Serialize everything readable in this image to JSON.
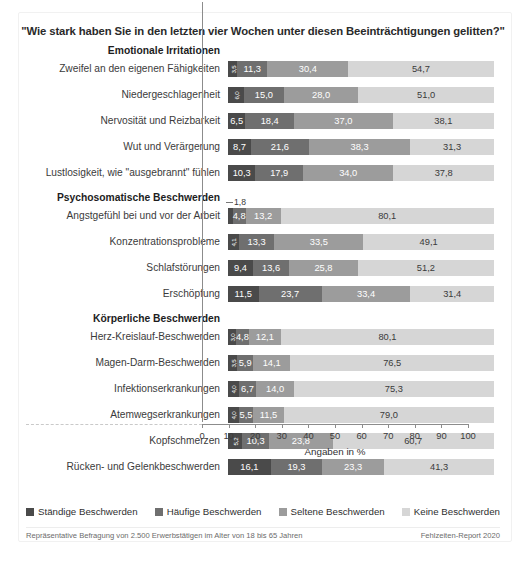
{
  "title": "\"Wie stark haben Sie in den letzten vier Wochen unter diesen Beeinträchtigungen gelitten?\"",
  "axis_title": "Angaben in %",
  "callout_1_8": "1,8",
  "legend": [
    {
      "label": "Ständige Beschwerden",
      "color": "#4a4a4a"
    },
    {
      "label": "Häufige Beschwerden",
      "color": "#6f6f6f"
    },
    {
      "label": "Seltene Beschwerden",
      "color": "#9c9c9c"
    },
    {
      "label": "Keine Beschwerden",
      "color": "#d6d6d6"
    }
  ],
  "footnote_left": "Repräsentative Befragung von  2.500 Erwerbstätigen im Alter von 18 bis 65 Jahren",
  "footnote_right": "Fehlzeiten-Report 2020",
  "chart_data": {
    "type": "bar",
    "orientation": "horizontal",
    "stacked": true,
    "stack_total": 100,
    "title": "\"Wie stark haben Sie in den letzten vier Wochen unter diesen Beeinträchtigungen gelitten?\"",
    "xlabel": "Angaben in %",
    "ylabel": "",
    "xlim": [
      0,
      100
    ],
    "xticks": [
      0,
      10,
      20,
      30,
      40,
      50,
      60,
      70,
      80,
      90,
      100
    ],
    "xticklabels": [
      "0",
      "10",
      "20",
      "30",
      "40",
      "50",
      "60",
      "70",
      "80",
      "90",
      "100"
    ],
    "grid": false,
    "legend_position": "bottom",
    "series": [
      {
        "name": "Ständige Beschwerden",
        "color": "#4a4a4a"
      },
      {
        "name": "Häufige Beschwerden",
        "color": "#6f6f6f"
      },
      {
        "name": "Seltene Beschwerden",
        "color": "#9c9c9c"
      },
      {
        "name": "Keine Beschwerden",
        "color": "#d6d6d6"
      }
    ],
    "groups": [
      {
        "header": "Emotionale Irritationen",
        "rows": [
          {
            "category": "Zweifel an den eigenen Fähigkeiten",
            "values": [
              3.5,
              11.3,
              30.4,
              54.7
            ],
            "labels": [
              "3,5",
              "11,3",
              "30,4",
              "54,7"
            ]
          },
          {
            "category": "Niedergeschlagenheit",
            "values": [
              6.0,
              15.0,
              28.0,
              51.0
            ],
            "labels": [
              "6,0",
              "15,0",
              "28,0",
              "51,0"
            ]
          },
          {
            "category": "Nervosität und Reizbarkeit",
            "values": [
              6.5,
              18.4,
              37.0,
              38.1
            ],
            "labels": [
              "6,5",
              "18,4",
              "37,0",
              "38,1"
            ]
          },
          {
            "category": "Wut und Verärgerung",
            "values": [
              8.7,
              21.6,
              38.3,
              31.3
            ],
            "labels": [
              "8,7",
              "21,6",
              "38,3",
              "31,3"
            ]
          },
          {
            "category": "Lustlosigkeit, wie \"ausgebrannt\" fühlen",
            "values": [
              10.3,
              17.9,
              34.0,
              37.8
            ],
            "labels": [
              "10,3",
              "17,9",
              "34,0",
              "37,8"
            ]
          }
        ]
      },
      {
        "header": "Psychosomatische Beschwerden",
        "rows": [
          {
            "category": "Angstgefühl bei und vor der Arbeit",
            "values": [
              1.8,
              4.8,
              13.2,
              80.1
            ],
            "labels": [
              "1,8",
              "4,8",
              "13,2",
              "80,1"
            ],
            "callout_first": true
          },
          {
            "category": "Konzentrationsprobleme",
            "values": [
              4.1,
              13.3,
              33.5,
              49.1
            ],
            "labels": [
              "4,1",
              "13,3",
              "33,5",
              "49,1"
            ]
          },
          {
            "category": "Schlafstörungen",
            "values": [
              9.4,
              13.6,
              25.8,
              51.2
            ],
            "labels": [
              "9,4",
              "13,6",
              "25,8",
              "51,2"
            ]
          },
          {
            "category": "Erschöpfung",
            "values": [
              11.5,
              23.7,
              33.4,
              31.4
            ],
            "labels": [
              "11,5",
              "23,7",
              "33,4",
              "31,4"
            ]
          }
        ]
      },
      {
        "header": "Körperliche Beschwerden",
        "rows": [
          {
            "category": "Herz-Kreislauf-Beschwerden",
            "values": [
              3.0,
              4.8,
              12.1,
              80.1
            ],
            "labels": [
              "3,0",
              "4,8",
              "12,1",
              "80,1"
            ]
          },
          {
            "category": "Magen-Darm-Beschwerden",
            "values": [
              3.5,
              5.9,
              14.1,
              76.5
            ],
            "labels": [
              "3,5",
              "5,9",
              "14,1",
              "76,5"
            ]
          },
          {
            "category": "Infektionserkrankungen",
            "values": [
              4.0,
              6.7,
              14.0,
              75.3
            ],
            "labels": [
              "4,0",
              "6,7",
              "14,0",
              "75,3"
            ]
          },
          {
            "category": "Atemwegserkrankungen",
            "values": [
              4.0,
              5.5,
              11.5,
              79.0
            ],
            "labels": [
              "4,0",
              "5,5",
              "11,5",
              "79,0"
            ]
          },
          {
            "category": "Kopfschmerzen",
            "values": [
              5.2,
              10.3,
              23.8,
              60.7
            ],
            "labels": [
              "5,2",
              "10,3",
              "23,8",
              "60,7"
            ]
          },
          {
            "category": "Rücken- und Gelenkbeschwerden",
            "values": [
              16.1,
              19.3,
              23.3,
              41.3
            ],
            "labels": [
              "16,1",
              "19,3",
              "23,3",
              "41,3"
            ]
          }
        ]
      }
    ]
  }
}
